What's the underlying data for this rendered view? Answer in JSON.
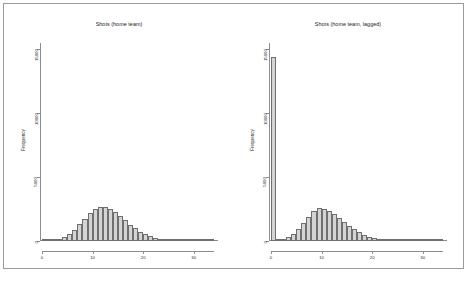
{
  "figure": {
    "background": "#ffffff",
    "border_color": "#9a9a9a",
    "bar_fill": "#d4d4d4",
    "bar_edge": "#6f6f6f",
    "axis_color": "#8d8d8d"
  },
  "chart_data": [
    {
      "type": "bar",
      "title": "Shots (home team)",
      "xlabel": "",
      "ylabel": "Frequency",
      "xlim": [
        0,
        34
      ],
      "ylim": [
        0,
        15500
      ],
      "xticks": [
        0,
        10,
        20,
        30
      ],
      "yticks": [
        0,
        5000,
        10000,
        15000
      ],
      "ytick_labels": [
        "0",
        "5000",
        "10000",
        "15000"
      ],
      "xtick_labels": [
        "0",
        "10",
        "20",
        "30"
      ],
      "grid": false,
      "legend": "none",
      "bin_width": 1,
      "categories": [
        0,
        1,
        2,
        3,
        4,
        5,
        6,
        7,
        8,
        9,
        10,
        11,
        12,
        13,
        14,
        15,
        16,
        17,
        18,
        19,
        20,
        21,
        22,
        23,
        24,
        25,
        26,
        27,
        28,
        29,
        30,
        31,
        32,
        33
      ],
      "values": [
        20,
        40,
        90,
        170,
        330,
        560,
        900,
        1320,
        1760,
        2180,
        2520,
        2700,
        2660,
        2520,
        2290,
        1960,
        1620,
        1290,
        980,
        720,
        520,
        370,
        260,
        180,
        120,
        80,
        55,
        35,
        22,
        14,
        9,
        5,
        3,
        2
      ]
    },
    {
      "type": "bar",
      "title": "Shots (home team, lagged)",
      "xlabel": "",
      "ylabel": "Frequency",
      "xlim": [
        0,
        34
      ],
      "ylim": [
        0,
        15500
      ],
      "xticks": [
        0,
        10,
        20,
        30
      ],
      "yticks": [
        0,
        5000,
        10000,
        15000
      ],
      "ytick_labels": [
        "0",
        "5000",
        "10000",
        "15000"
      ],
      "xtick_labels": [
        "0",
        "10",
        "20",
        "30"
      ],
      "grid": false,
      "legend": "none",
      "bin_width": 1,
      "categories": [
        0,
        1,
        2,
        3,
        4,
        5,
        6,
        7,
        8,
        9,
        10,
        11,
        12,
        13,
        14,
        15,
        16,
        17,
        18,
        19,
        20,
        21,
        22,
        23,
        24,
        25,
        26,
        27,
        28,
        29,
        30,
        31,
        32,
        33
      ],
      "values": [
        14400,
        60,
        150,
        300,
        580,
        950,
        1420,
        1900,
        2320,
        2560,
        2530,
        2380,
        2120,
        1820,
        1500,
        1190,
        910,
        670,
        480,
        330,
        225,
        150,
        100,
        65,
        42,
        27,
        17,
        11,
        7,
        4,
        3,
        2,
        1,
        1
      ]
    }
  ]
}
